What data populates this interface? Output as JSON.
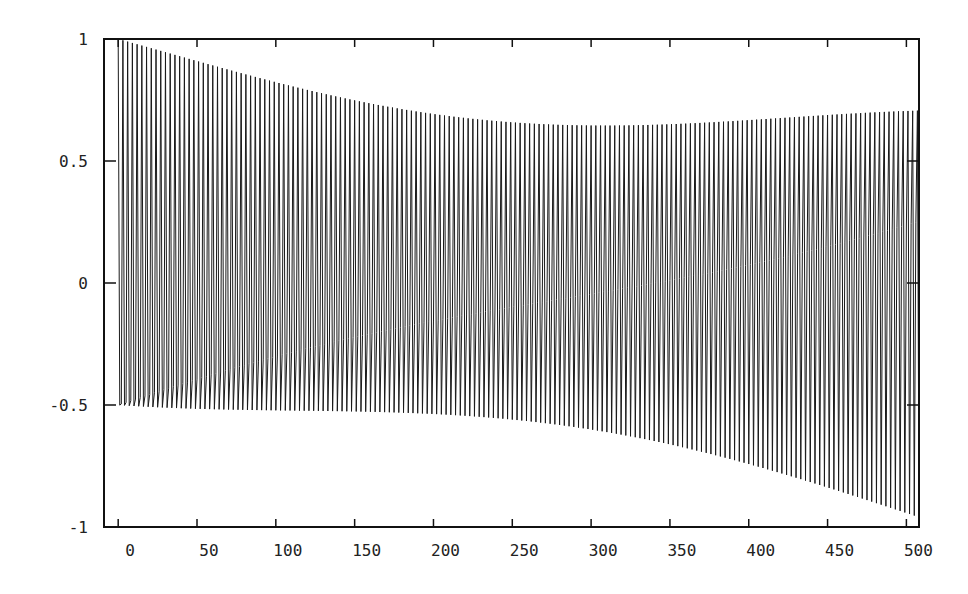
{
  "chart_data": {
    "type": "line",
    "title": "",
    "xlabel": "",
    "ylabel": "",
    "xlim": [
      -9,
      508
    ],
    "ylim": [
      -1,
      1
    ],
    "grid": false,
    "legend": null,
    "xticks": [
      0,
      50,
      100,
      150,
      200,
      250,
      300,
      350,
      400,
      450,
      500
    ],
    "xtick_labels": [
      "0",
      "50",
      "100",
      "150",
      "200",
      "250",
      "300",
      "350",
      "400",
      "450",
      "500"
    ],
    "yticks": [
      1,
      0.5,
      0,
      -0.5,
      -1
    ],
    "ytick_labels": [
      "1",
      "0.5",
      "0",
      "-0.5",
      "-1"
    ],
    "series": [
      {
        "name": "signal",
        "description": "Densely oscillating sampled sinusoid (~3 samples per cycle) with beat envelope: peak amplitude 1 at n=0 and n=511, dipping to ~0.71 at n=256",
        "n_samples": 512,
        "x_start": 0,
        "x_end": 511,
        "samples_per_cycle": 3.0,
        "phase_drift_cycles": 0.125,
        "envelope_peak_edges": 1.0,
        "envelope_peak_center": 0.71,
        "envelope_min_x": 256,
        "color": "#1a1a1a"
      }
    ]
  },
  "style": {
    "frame_color": "#111111",
    "line_color": "#1a1a1a",
    "background": "#ffffff"
  }
}
